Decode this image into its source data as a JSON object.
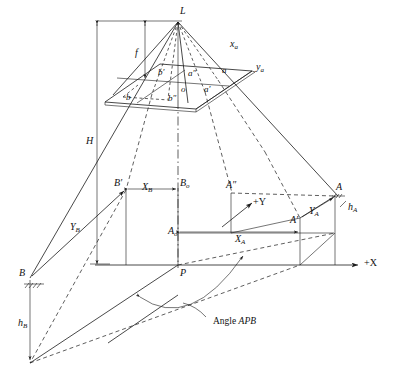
{
  "figure": {
    "domain": "diagram",
    "background_color": "#ffffff",
    "line_color": "#1a1a1a"
  },
  "labels": {
    "exposure_station": "L",
    "focal_length": "f",
    "flying_height": "H",
    "photo_origin": "o",
    "image_point_a": "a",
    "image_point_a_prime": "a′",
    "image_point_a_dprime": "a″",
    "image_point_b": "b",
    "image_point_b_prime": "b′",
    "image_point_b_dprime": "b″",
    "photo_axis_x": "x",
    "photo_axis_x_sub": "a",
    "photo_axis_y": "y",
    "photo_axis_y_sub": "a",
    "ground_point_a": "A",
    "ground_point_a_prime": "A′",
    "ground_point_a_dprime": "A″",
    "ground_point_a_sub_o": "A",
    "ground_point_a_o_sub": "o",
    "ground_point_b": "B",
    "ground_point_b_prime": "B′",
    "ground_point_b_sub_o": "B",
    "ground_point_b_o_sub": "o",
    "ground_point_p": "P",
    "height_a": "h",
    "height_a_sub": "A",
    "height_b": "h",
    "height_b_sub": "B",
    "coord_xa": "X",
    "coord_xa_sub": "A",
    "coord_ya": "Y",
    "coord_ya_sub": "A",
    "coord_xb": "X",
    "coord_xb_sub": "B",
    "coord_yb": "Y",
    "coord_yb_sub": "B",
    "axis_plus_x": "+X",
    "axis_plus_y": "+Y",
    "angle_note_prefix": "Angle ",
    "angle_note_points": "APB"
  }
}
